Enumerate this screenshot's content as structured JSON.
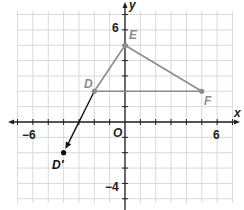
{
  "chart_data": {
    "type": "scatter",
    "title": "",
    "xlabel": "x",
    "ylabel": "y",
    "xlim": [
      -7,
      7
    ],
    "ylim": [
      -5,
      7
    ],
    "grid": true,
    "origin_label": "O",
    "x_tick_labels": [
      {
        "value": -6,
        "label": "−6"
      },
      {
        "value": 6,
        "label": "6"
      }
    ],
    "y_tick_labels": [
      {
        "value": 6,
        "label": "6"
      },
      {
        "value": -4,
        "label": "−4"
      }
    ],
    "points": [
      {
        "name": "D",
        "x": -2,
        "y": 2,
        "color": "#8c8c8c"
      },
      {
        "name": "E",
        "x": 0,
        "y": 5,
        "color": "#8c8c8c"
      },
      {
        "name": "F",
        "x": 5,
        "y": 2,
        "color": "#8c8c8c"
      },
      {
        "name": "D′",
        "x": -4,
        "y": -2,
        "color": "#111111"
      }
    ],
    "segments": [
      {
        "from": "D",
        "to": "E",
        "color": "#8c8c8c"
      },
      {
        "from": "E",
        "to": "F",
        "color": "#8c8c8c"
      },
      {
        "from": "D",
        "to": "F",
        "color": "#8c8c8c"
      }
    ],
    "vectors": [
      {
        "from": "D",
        "to": "D′",
        "color": "#111111"
      }
    ]
  },
  "labels": {
    "x_axis": "x",
    "y_axis": "y",
    "origin": "O",
    "x_neg6": "−6",
    "x_pos6": "6",
    "y_pos6": "6",
    "y_neg4": "−4",
    "D": "D",
    "E": "E",
    "F": "F",
    "D_prime": "D′"
  }
}
